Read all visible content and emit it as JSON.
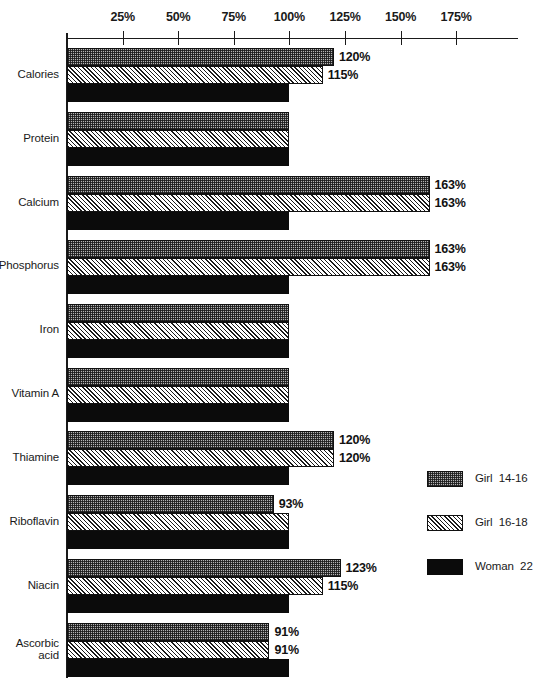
{
  "chart_data": {
    "type": "bar",
    "orientation": "horizontal",
    "title": "",
    "subtitle": "",
    "xlabel": "",
    "ylabel": "",
    "grid": false,
    "xlim": [
      0,
      180
    ],
    "axis_ticks": [
      {
        "value": 25,
        "label": "25%"
      },
      {
        "value": 50,
        "label": "50%"
      },
      {
        "value": 75,
        "label": "75%"
      },
      {
        "value": 100,
        "label": "100%"
      },
      {
        "value": 125,
        "label": "125%"
      },
      {
        "value": 150,
        "label": "150%"
      },
      {
        "value": 175,
        "label": "175%"
      }
    ],
    "categories": [
      "Calories",
      "Protein",
      "Calcium",
      "Phosphorus",
      "Iron",
      "Vitamin A",
      "Thiamine",
      "Riboflavin",
      "Niacin",
      "Ascorbic\nacid"
    ],
    "legend_position": "right",
    "series": [
      {
        "name": "Girl  14-16",
        "pattern": "dotted-grey",
        "color": "#b4b4b4",
        "values": [
          120,
          100,
          163,
          163,
          100,
          100,
          120,
          93,
          123,
          91
        ],
        "labels": [
          "120%",
          "",
          "163%",
          "163%",
          "",
          "",
          "120%",
          "93%",
          "123%",
          "91%"
        ]
      },
      {
        "name": "Girl  16-18",
        "pattern": "diagonal-hatch",
        "color": "#ffffff",
        "values": [
          115,
          100,
          163,
          163,
          100,
          100,
          120,
          100,
          115,
          91
        ],
        "labels": [
          "115%",
          "",
          "163%",
          "163%",
          "",
          "",
          "120%",
          "",
          "115%",
          "91%"
        ]
      },
      {
        "name": "Woman  22",
        "pattern": "solid-black",
        "color": "#0b0b0b",
        "values": [
          100,
          100,
          100,
          100,
          100,
          100,
          100,
          100,
          100,
          100
        ],
        "labels": [
          "",
          "",
          "",
          "",
          "",
          "",
          "",
          "",
          "",
          ""
        ]
      }
    ]
  }
}
